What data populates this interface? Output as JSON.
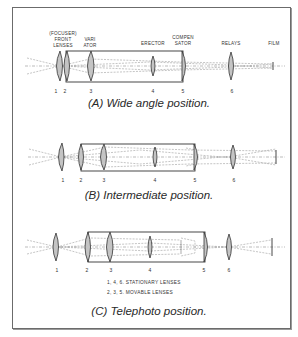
{
  "labels": {
    "focuser_front_lenses": [
      "(FOCUSER)",
      "FRONT",
      "LENSES"
    ],
    "variator": [
      "VARI",
      "ATOR"
    ],
    "erector": "ERECTOR",
    "compensator": [
      "COMPEN",
      "SATOR"
    ],
    "relays": "RELAYS",
    "film": "FILM"
  },
  "panels": [
    {
      "id": "A",
      "caption": "(A)  Wide angle position.",
      "lens_numbers": [
        "1",
        "2",
        "3",
        "4",
        "5",
        "6"
      ]
    },
    {
      "id": "B",
      "caption": "(B)  Intermediate position.",
      "lens_numbers": [
        "1",
        "2",
        "3",
        "4",
        "5",
        "6"
      ]
    },
    {
      "id": "C",
      "caption": "(C)  Telephoto position.",
      "lens_numbers": [
        "1",
        "2",
        "3",
        "4",
        "5",
        "6"
      ]
    }
  ],
  "legend": {
    "stationary": "1, 4, 6. STATIONARY LENSES",
    "movable": "2, 3, 5. MOVABLE LENSES"
  },
  "colors": {
    "lens_fill": "#c4c4c4",
    "line": "#333333",
    "ray": "#8a8a8a"
  }
}
